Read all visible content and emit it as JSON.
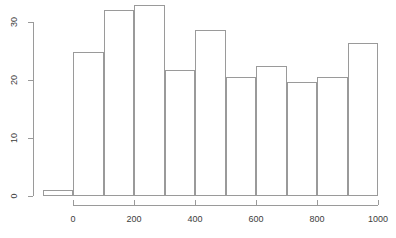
{
  "chart_data": {
    "type": "bar",
    "title": "",
    "subtitle": "",
    "xlabel": "",
    "ylabel": "",
    "grid": false,
    "legend": null,
    "xlim": [
      -100,
      1000
    ],
    "ylim": [
      0,
      33.5
    ],
    "bin_width": 100,
    "bin_edges": [
      -100,
      0,
      100,
      200,
      300,
      400,
      500,
      600,
      700,
      800,
      900,
      1000
    ],
    "categories": [
      "-100–0",
      "0–100",
      "100–200",
      "200–300",
      "300–400",
      "400–500",
      "500–600",
      "600–700",
      "700–800",
      "800–900",
      "900–1000"
    ],
    "values": [
      1.0,
      24.8,
      32.0,
      33.0,
      21.7,
      28.7,
      20.6,
      22.5,
      19.7,
      20.6,
      26.4
    ],
    "xticks": [
      0,
      200,
      400,
      600,
      800,
      1000
    ],
    "xtick_labels": [
      "0",
      "200",
      "400",
      "600",
      "800",
      "1000"
    ],
    "yticks": [
      0,
      10,
      20,
      30
    ],
    "ytick_labels": [
      "0",
      "10",
      "20",
      "30"
    ],
    "colors": {
      "bar_border": "#9a9a9a",
      "bar_fill": "transparent",
      "axis": "#9a9a9a",
      "text": "#3d3d3d",
      "background": "#ffffff"
    }
  }
}
